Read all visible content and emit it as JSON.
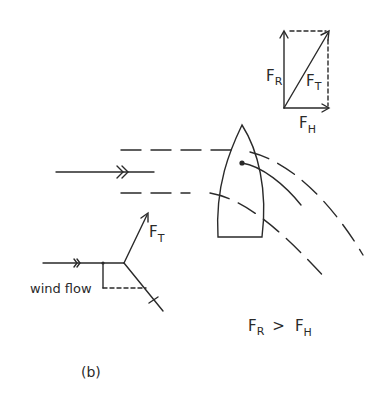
{
  "figure": {
    "panel_label": "(b)",
    "relation": {
      "left": "F",
      "left_sub": "R",
      "op": ">",
      "right": "F",
      "right_sub": "H"
    }
  },
  "vector_diagram": {
    "resultant": {
      "symbol": "F",
      "sub": "T"
    },
    "vertical": {
      "symbol": "F",
      "sub": "R"
    },
    "horizontal": {
      "symbol": "F",
      "sub": "H"
    }
  },
  "sail_diagram": {
    "force_label": {
      "symbol": "F",
      "sub": "T"
    },
    "wind_label": "wind flow"
  },
  "colors": {
    "ink": "#2a2a2a",
    "background": "#ffffff"
  }
}
